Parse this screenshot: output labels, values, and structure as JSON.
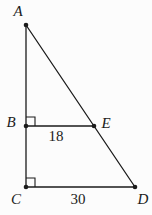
{
  "figure": {
    "type": "geometry-diagram",
    "width": 152,
    "height": 215,
    "background_color": "#fcfcfc",
    "line_color": "#1b1b1b",
    "label_color": "#1b1b1b",
    "line_width": 1.3,
    "dot_radius": 2.3,
    "points": [
      {
        "name": "A",
        "x": 26,
        "y": 25,
        "label": "A",
        "label_x": 18,
        "label_y": 16
      },
      {
        "name": "B",
        "x": 26,
        "y": 126,
        "label": "B",
        "label_x": 11,
        "label_y": 127
      },
      {
        "name": "C",
        "x": 26,
        "y": 187,
        "label": "C",
        "label_x": 16,
        "label_y": 204
      },
      {
        "name": "D",
        "x": 135,
        "y": 187,
        "label": "D",
        "label_x": 143,
        "label_y": 204
      },
      {
        "name": "E",
        "x": 94,
        "y": 126,
        "label": "E",
        "label_x": 106,
        "label_y": 128
      }
    ],
    "segments": [
      {
        "id": "AC",
        "from": "A",
        "to": "C"
      },
      {
        "id": "AD",
        "from": "A",
        "to": "D"
      },
      {
        "id": "BE",
        "from": "B",
        "to": "E"
      },
      {
        "id": "CD",
        "from": "C",
        "to": "D"
      }
    ],
    "right_angle_marks": [
      {
        "at": "B",
        "size": 9
      },
      {
        "at": "C",
        "size": 9
      }
    ],
    "measurements": [
      {
        "segment": "BE",
        "value": "18",
        "x": 56,
        "y": 141
      },
      {
        "segment": "CD",
        "value": "30",
        "x": 78,
        "y": 204
      }
    ]
  }
}
